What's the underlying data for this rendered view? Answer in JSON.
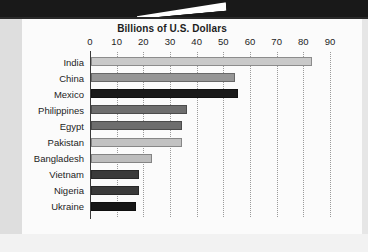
{
  "banner": {
    "name": "top-black-banner"
  },
  "chart_data": {
    "type": "bar",
    "orientation": "horizontal",
    "title": "Billions of U.S. Dollars",
    "xlabel": "",
    "ylabel": "",
    "xlim": [
      0,
      90
    ],
    "xticks": [
      0,
      10,
      20,
      30,
      40,
      50,
      60,
      70,
      80,
      90
    ],
    "tick_labels": [
      "0",
      "10",
      "20",
      "30",
      "40",
      "50",
      "60",
      "70",
      "80",
      "90"
    ],
    "grid": "vertical-dotted",
    "legend": "none",
    "categories": [
      "India",
      "China",
      "Mexico",
      "Philippines",
      "Egypt",
      "Pakistan",
      "Bangladesh",
      "Vietnam",
      "Nigeria",
      "Ukraine"
    ],
    "values": [
      83,
      54,
      55,
      36,
      34,
      34,
      23,
      18,
      18,
      17
    ],
    "bar_colors": [
      "#c9c9c9",
      "#969696",
      "#1a1a1a",
      "#6e6e6e",
      "#6e6e6e",
      "#c2c2c2",
      "#bdbdbd",
      "#3a3a3a",
      "#3a3a3a",
      "#161616"
    ]
  },
  "colors": {
    "background": "#fbfbfb",
    "banner": "#191919",
    "axis": "#3a3a3a",
    "gridline": "#9a9a9a",
    "text": "#1d1d1d"
  }
}
